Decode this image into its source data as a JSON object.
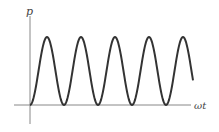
{
  "figure": {
    "y_axis_label": "p",
    "x_axis_label": "ωt",
    "colors": {
      "curve": "#333333",
      "axis": "#888888",
      "label": "#444444"
    }
  },
  "chart_data": {
    "type": "line",
    "title": "",
    "xlabel": "ωt",
    "ylabel": "p",
    "function": "sin^2",
    "cycles_shown": 4.8,
    "ylim": [
      0,
      1
    ],
    "grid": false,
    "legend": null
  }
}
